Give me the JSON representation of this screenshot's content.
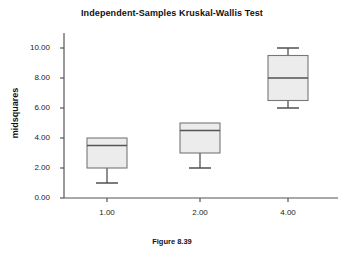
{
  "chart_data": {
    "type": "box",
    "title": "Independent-Samples Kruskal-Wallis Test",
    "caption": "Figure 8.39",
    "xlabel": "",
    "ylabel": "midsquares",
    "ylim": [
      0.0,
      11.0
    ],
    "grid": false,
    "legend": "none",
    "y_ticks": [
      "0.00",
      "2.00",
      "4.00",
      "6.00",
      "8.00",
      "10.00"
    ],
    "y_tick_values": [
      0.0,
      2.0,
      4.0,
      6.0,
      8.0,
      10.0
    ],
    "categories": [
      "1.00",
      "2.00",
      "4.00"
    ],
    "boxes": [
      {
        "category": "1.00",
        "whisker_low": 1.0,
        "q1": 2.0,
        "median": 3.5,
        "q3": 4.0,
        "whisker_high": 4.0,
        "has_upper_whisker": false,
        "has_lower_whisker": true
      },
      {
        "category": "2.00",
        "whisker_low": 2.0,
        "q1": 3.0,
        "median": 4.5,
        "q3": 5.0,
        "whisker_high": 5.0,
        "has_upper_whisker": false,
        "has_lower_whisker": true
      },
      {
        "category": "4.00",
        "whisker_low": 6.0,
        "q1": 6.5,
        "median": 8.0,
        "q3": 9.5,
        "whisker_high": 10.0,
        "has_upper_whisker": true,
        "has_lower_whisker": true
      }
    ],
    "colors": {
      "box_fill": "#ececec",
      "box_stroke": "#777777",
      "median_stroke": "#555555",
      "whisker_stroke": "#444444",
      "axis_stroke": "#555555",
      "text": "#111111",
      "background": "#ffffff"
    }
  }
}
